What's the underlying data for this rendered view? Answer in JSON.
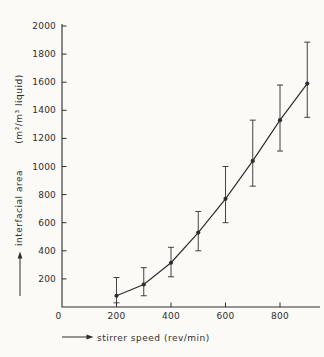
{
  "figure": {
    "background": "#fbfaf7",
    "ink": "#2e2e2e"
  },
  "chart_data": {
    "type": "line",
    "title": "",
    "xlabel": "stirrer speed (rev/min)",
    "ylabel_line1": "interfacial area",
    "ylabel_line2": "(m²/m³ liquid)",
    "origin_label": "0",
    "grid": false,
    "legend": null,
    "marker": "filled-circle",
    "error_bars": true,
    "xlim": [
      0,
      945
    ],
    "ylim": [
      0,
      2000
    ],
    "x_ticks": [
      200,
      400,
      600,
      800
    ],
    "y_ticks": [
      200,
      400,
      600,
      800,
      1000,
      1200,
      1400,
      1600,
      1800,
      2000
    ],
    "x": [
      200,
      300,
      400,
      500,
      600,
      700,
      800,
      900
    ],
    "series": [
      {
        "name": "interfacial area",
        "values": [
          80,
          160,
          315,
          530,
          770,
          1040,
          1330,
          1590
        ],
        "err_low": [
          30,
          80,
          215,
          400,
          600,
          860,
          1110,
          1350
        ],
        "err_high": [
          210,
          280,
          425,
          680,
          1000,
          1330,
          1580,
          1885
        ]
      }
    ]
  }
}
